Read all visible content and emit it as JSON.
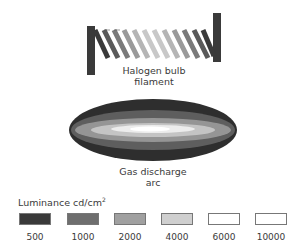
{
  "filament": {
    "caption_line1": "Halogen bulb",
    "caption_line2": "filament"
  },
  "arc": {
    "caption_line1": "Gas discharge",
    "caption_line2": "arc"
  },
  "legend": {
    "title": "Luminance cd/cm",
    "title_superscript": "2",
    "items": [
      {
        "label": "500",
        "color": "#3a3a3a"
      },
      {
        "label": "1000",
        "color": "#6e6e6e"
      },
      {
        "label": "2000",
        "color": "#a0a0a0"
      },
      {
        "label": "4000",
        "color": "#cfcfcf"
      },
      {
        "label": "6000",
        "color": "#ffffff"
      },
      {
        "label": "10000",
        "color": "#ffffff"
      }
    ]
  }
}
